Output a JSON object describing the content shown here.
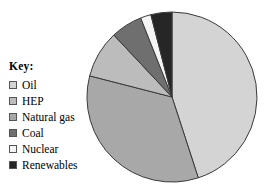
{
  "legend": {
    "title": "Key:",
    "items": [
      {
        "label": "Oil",
        "color": "#d4d4d4",
        "swatch_name": "legend-swatch-oil"
      },
      {
        "label": "HEP",
        "color": "#bcbcbc",
        "swatch_name": "legend-swatch-hep"
      },
      {
        "label": "Natural gas",
        "color": "#a8a8a8",
        "swatch_name": "legend-swatch-natural-gas"
      },
      {
        "label": "Coal",
        "color": "#6f6f6f",
        "swatch_name": "legend-swatch-coal"
      },
      {
        "label": "Nuclear",
        "color": "#f4f4f4",
        "swatch_name": "legend-swatch-nuclear"
      },
      {
        "label": "Renewables",
        "color": "#262626",
        "swatch_name": "legend-swatch-renewables"
      }
    ]
  },
  "chart_data": {
    "type": "pie",
    "title": "",
    "xlabel": "",
    "ylabel": "",
    "legend_position": "left",
    "grid": false,
    "start_angle_deg": 0,
    "direction": "clockwise",
    "center": {
      "x": 172,
      "y": 97
    },
    "radius": 85,
    "outline_color": "#3a3a3a",
    "categories": [
      "Oil",
      "Natural gas",
      "HEP",
      "Coal",
      "Nuclear",
      "Renewables"
    ],
    "values": [
      45,
      34,
      9,
      6,
      2,
      4
    ],
    "unit": "%",
    "slices": [
      {
        "label": "Oil",
        "value": 45,
        "color": "#d4d4d4"
      },
      {
        "label": "Natural gas",
        "value": 34,
        "color": "#a8a8a8"
      },
      {
        "label": "HEP",
        "value": 9,
        "color": "#bcbcbc"
      },
      {
        "label": "Coal",
        "value": 6,
        "color": "#6f6f6f"
      },
      {
        "label": "Nuclear",
        "value": 2,
        "color": "#f4f4f4"
      },
      {
        "label": "Renewables",
        "value": 4,
        "color": "#262626"
      }
    ]
  }
}
